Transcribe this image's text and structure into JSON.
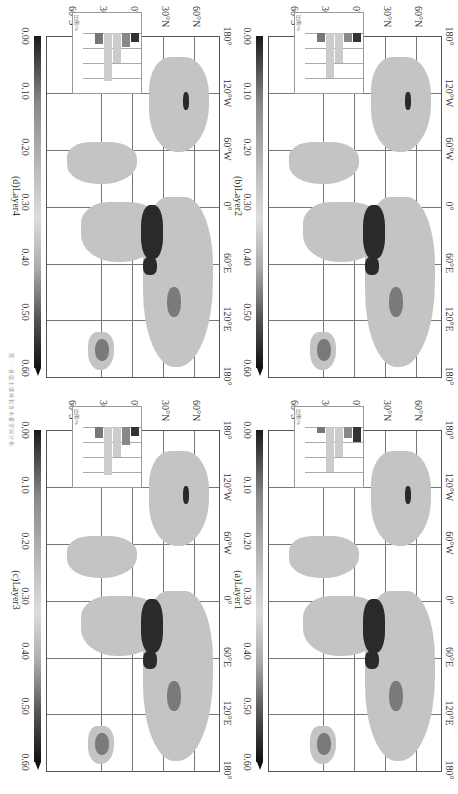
{
  "figure": {
    "caption": "图 ·· 各层土壤体积含水量空间分布",
    "colorbar_ticks": [
      "0.00",
      "0.10",
      "0.20",
      "0.30",
      "0.40",
      "0.50",
      "0.60"
    ],
    "x_ticks": [
      "180°",
      "120°W",
      "60°W",
      "0°",
      "60°E",
      "120°E",
      "180°"
    ],
    "y_ticks": [
      "60°N",
      "30°N",
      "0°",
      "30°S",
      "60°S"
    ],
    "inset_y_labels": [
      "40",
      "30",
      "20",
      "10",
      "0"
    ],
    "inset_ylabel": "比例/%",
    "inset_x_labels": [
      "0.0",
      "0.1",
      "0.2",
      "0.3",
      "0.4",
      "0.5",
      "0.6"
    ],
    "panels": [
      {
        "id": "a",
        "label": "(a)Layer1"
      },
      {
        "id": "b",
        "label": "(b)Layer2"
      },
      {
        "id": "c",
        "label": "(c)Layer3"
      },
      {
        "id": "d",
        "label": "(d)Layer4"
      }
    ]
  },
  "chart_data": [
    {
      "type": "heatmap",
      "title": "(a)Layer1",
      "xlabel": "Longitude",
      "ylabel": "Latitude",
      "x_ticks": [
        "180°",
        "120°W",
        "60°W",
        "0°",
        "60°E",
        "120°E",
        "180°"
      ],
      "y_ticks": [
        "60°N",
        "30°N",
        "0°",
        "30°S",
        "60°S"
      ],
      "colorbar": {
        "range": [
          0.0,
          0.6
        ],
        "ticks": [
          0.0,
          0.1,
          0.2,
          0.3,
          0.4,
          0.5,
          0.6
        ],
        "extend": "max"
      },
      "grid": true,
      "inset_histogram": {
        "type": "bar",
        "orientation": "horizontal",
        "categories": [
          "0.0-0.1",
          "0.1-0.2",
          "0.2-0.3",
          "0.3-0.4",
          "0.4-0.5",
          "0.5-0.6"
        ],
        "values": [
          10,
          7,
          20,
          30,
          4,
          0
        ],
        "ylabel": "比例/%",
        "range": [
          0,
          40
        ]
      }
    },
    {
      "type": "heatmap",
      "title": "(b)Layer2",
      "xlabel": "Longitude",
      "ylabel": "Latitude",
      "x_ticks": [
        "180°",
        "120°W",
        "60°W",
        "0°",
        "60°E",
        "120°E",
        "180°"
      ],
      "y_ticks": [
        "60°N",
        "30°N",
        "0°",
        "30°S",
        "60°S"
      ],
      "colorbar": {
        "range": [
          0.0,
          0.6
        ],
        "ticks": [
          0.0,
          0.1,
          0.2,
          0.3,
          0.4,
          0.5,
          0.6
        ],
        "extend": "max"
      },
      "grid": true,
      "inset_histogram": {
        "type": "bar",
        "orientation": "horizontal",
        "categories": [
          "0.0-0.1",
          "0.1-0.2",
          "0.2-0.3",
          "0.3-0.4",
          "0.4-0.5",
          "0.5-0.6"
        ],
        "values": [
          6,
          6,
          20,
          30,
          6,
          0
        ],
        "ylabel": "比例/%",
        "range": [
          0,
          40
        ]
      }
    },
    {
      "type": "heatmap",
      "title": "(c)Layer3",
      "xlabel": "Longitude",
      "ylabel": "Latitude",
      "x_ticks": [
        "180°",
        "120°W",
        "60°W",
        "0°",
        "60°E",
        "120°E",
        "180°"
      ],
      "y_ticks": [
        "60°N",
        "30°N",
        "0°",
        "30°S",
        "60°S"
      ],
      "colorbar": {
        "range": [
          0.0,
          0.6
        ],
        "ticks": [
          0.0,
          0.1,
          0.2,
          0.3,
          0.4,
          0.5,
          0.6
        ],
        "extend": "max"
      },
      "grid": true,
      "inset_histogram": {
        "type": "bar",
        "orientation": "horizontal",
        "categories": [
          "0.0-0.1",
          "0.1-0.2",
          "0.2-0.3",
          "0.3-0.4",
          "0.4-0.5",
          "0.5-0.6"
        ],
        "values": [
          6,
          12,
          20,
          32,
          7,
          0
        ],
        "ylabel": "比例/%",
        "range": [
          0,
          40
        ]
      }
    },
    {
      "type": "heatmap",
      "title": "(d)Layer4",
      "xlabel": "Longitude",
      "ylabel": "Latitude",
      "x_ticks": [
        "180°",
        "120°W",
        "60°W",
        "0°",
        "60°E",
        "120°E",
        "180°"
      ],
      "y_ticks": [
        "60°N",
        "30°N",
        "0°",
        "30°S",
        "60°S"
      ],
      "colorbar": {
        "range": [
          0.0,
          0.6
        ],
        "ticks": [
          0.0,
          0.1,
          0.2,
          0.3,
          0.4,
          0.5,
          0.6
        ],
        "extend": "max"
      },
      "grid": true,
      "inset_histogram": {
        "type": "bar",
        "orientation": "horizontal",
        "categories": [
          "0.0-0.1",
          "0.1-0.2",
          "0.2-0.3",
          "0.3-0.4",
          "0.4-0.5",
          "0.5-0.6"
        ],
        "values": [
          6,
          9,
          20,
          32,
          7,
          0
        ],
        "ylabel": "比例/%",
        "range": [
          0,
          40
        ]
      }
    }
  ]
}
